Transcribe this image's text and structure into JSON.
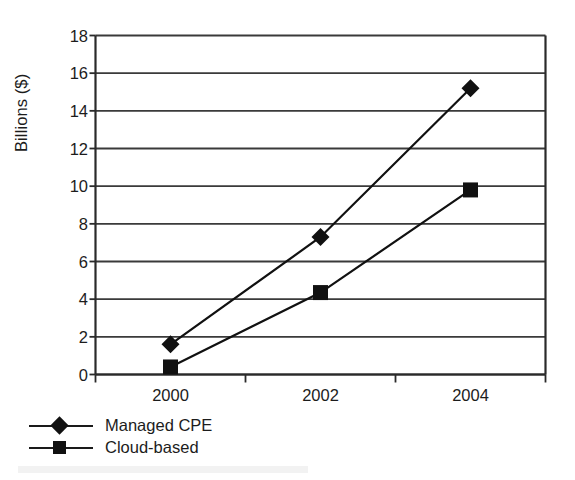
{
  "chart_data": {
    "type": "line",
    "title": "",
    "subtitle": "",
    "xlabel": "",
    "ylabel": "Billions ($)",
    "categories": [
      "2000",
      "2002",
      "2004"
    ],
    "x_tick_labels": [
      "2000",
      "2002",
      "2004"
    ],
    "y_tick_labels": [
      "0",
      "2",
      "4",
      "6",
      "8",
      "10",
      "12",
      "14",
      "16",
      "18"
    ],
    "y_ticks": [
      0,
      2,
      4,
      6,
      8,
      10,
      12,
      14,
      16,
      18
    ],
    "ylim": [
      0,
      18
    ],
    "grid": "horizontal",
    "legend_position": "below-left",
    "series": [
      {
        "name": "Managed CPE",
        "marker": "diamond",
        "color": "#111111",
        "values": [
          1.6,
          7.3,
          15.2
        ]
      },
      {
        "name": "Cloud-based",
        "marker": "square",
        "color": "#111111",
        "values": [
          0.4,
          4.35,
          9.8
        ]
      }
    ]
  },
  "figure": {
    "y_axis_title": "Billions ($)",
    "legend": [
      {
        "label": "Managed CPE",
        "marker": "diamond-marker-icon"
      },
      {
        "label": "Cloud-based",
        "marker": "square-marker-icon"
      }
    ],
    "colors": {
      "axis": "#2a2a2a",
      "gridline": "#3a3a3a",
      "series": "#111111",
      "background": "#ffffff"
    }
  }
}
